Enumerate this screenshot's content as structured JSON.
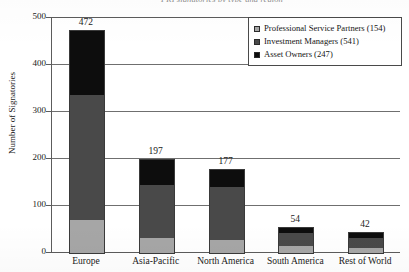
{
  "figure": {
    "title_clipped": "PRI signatories by type and region",
    "title_visible": false
  },
  "chart_data": {
    "type": "bar",
    "stacked": true,
    "orientation": "vertical",
    "title": "",
    "xlabel": "",
    "ylabel": "Number of Signatories",
    "ylim": [
      0,
      500
    ],
    "yticks": [
      0,
      100,
      200,
      300,
      400,
      500
    ],
    "ytick_labels": [
      "0",
      "100",
      "200",
      "300",
      "400",
      "500"
    ],
    "grid": true,
    "grid_axis": "y",
    "legend_position": "top-right",
    "categories": [
      "Europe",
      "Asia-Pacific",
      "North America",
      "South America",
      "Rest of World"
    ],
    "totals": [
      472,
      197,
      177,
      54,
      42
    ],
    "series": [
      {
        "name": "Professional Service Partners (154)",
        "label": "Professional Service Partners",
        "count": 154,
        "color": "#a6a6a6",
        "values": [
          70,
          32,
          28,
          14,
          10
        ]
      },
      {
        "name": "Investment Managers (541)",
        "label": "Investment Managers",
        "count": 541,
        "color": "#494949",
        "values": [
          267,
          113,
          112,
          28,
          21
        ]
      },
      {
        "name": "Asset Owners (247)",
        "label": "Asset Owners",
        "count": 247,
        "color": "#0d0d0d",
        "values": [
          135,
          52,
          37,
          12,
          11
        ]
      }
    ],
    "bar_value_labels": [
      "472",
      "197",
      "177",
      "54",
      "42"
    ]
  },
  "legend": {
    "items": [
      {
        "label": "Professional Service Partners (154)",
        "color": "#a6a6a6"
      },
      {
        "label": "Investment Managers (541)",
        "color": "#494949"
      },
      {
        "label": "Asset Owners (247)",
        "color": "#0d0d0d"
      }
    ]
  }
}
